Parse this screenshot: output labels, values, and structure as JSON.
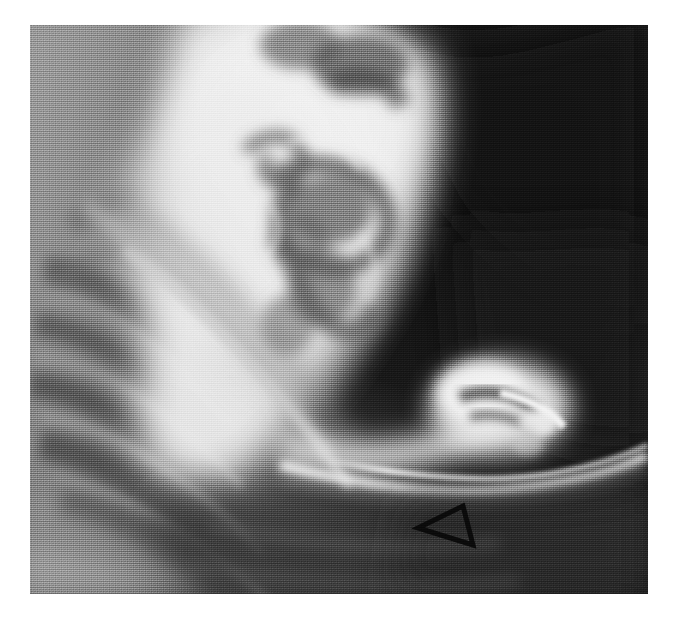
{
  "figure": {
    "kind": "radiograph",
    "modality_label": "Upper GI barium contrast radiograph",
    "view_label": "Lateral / oblique projection",
    "caption": "",
    "background_color": "#ffffff",
    "plate": {
      "x": 30,
      "y": 25,
      "width": 618,
      "height": 569,
      "border_color": "#ffffff",
      "base_color": "#1c1c1c"
    }
  },
  "tone_palette": {
    "air_black": "#141414",
    "deep_shadow": "#232323",
    "soft_tissue_dark": "#3a3a3a",
    "soft_tissue_mid": "#6b6b6b",
    "soft_tissue_light": "#8f8f8f",
    "fat_plane": "#a8a8a8",
    "barium_dim": "#cfcfcf",
    "barium_bright": "#ebebeb",
    "barium_peak": "#f7f7f7",
    "marker_stroke": "#0a0a0a"
  },
  "annotations": [
    {
      "id": "arrowhead-marker",
      "type": "open-triangle-arrowhead",
      "label": "arrowhead",
      "points": "388,503 433,481 443,520",
      "stroke_color": "#0b0b0b",
      "stroke_width": 5,
      "fill": "none",
      "direction": "points-left",
      "indicates": "focal abnormality / ulcer niche along inferior gastric wall"
    }
  ],
  "anatomy_regions": [
    {
      "id": "gas-bubble-upper-right",
      "label": "Gas-filled lumen (radiolucent)",
      "tone": "#141414"
    },
    {
      "id": "barium-pool-body",
      "label": "Barium-filled gastric body",
      "tone": "#f0f0f0"
    },
    {
      "id": "rugal-folds",
      "label": "Gastric rugal folds",
      "tone": "#5e5e5e"
    },
    {
      "id": "greater-curvature-line",
      "label": "Barium-coated greater curvature",
      "tone": "#f2f2f2"
    },
    {
      "id": "duodenal-bulb",
      "label": "Duodenal bulb / pyloric region",
      "tone": "#e8e8e8"
    },
    {
      "id": "rib-shadows-left",
      "label": "Rib and soft tissue shadows",
      "tone": "#7a7a7a"
    },
    {
      "id": "diagonal-fat-plane",
      "label": "Diagonal tissue interface",
      "tone": "#c4c4c4"
    }
  ]
}
